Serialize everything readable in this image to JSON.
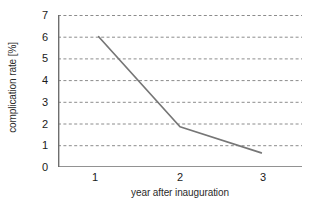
{
  "chart_data": {
    "type": "line",
    "title": "",
    "subtitle": "",
    "xlabel": "year after inauguration",
    "ylabel": "complication rate [%]",
    "categories": [
      "1",
      "2",
      "3"
    ],
    "x": [
      1,
      2,
      3
    ],
    "values": [
      6.0,
      1.85,
      0.65
    ],
    "series": [
      {
        "name": "complication rate",
        "values": [
          6.0,
          1.85,
          0.65
        ]
      }
    ],
    "xlim": [
      0.5,
      3.5
    ],
    "ylim": [
      0,
      7
    ],
    "yticks": [
      0,
      1,
      2,
      3,
      4,
      5,
      6,
      7
    ],
    "ytick_labels": [
      "0",
      "1",
      "2",
      "3",
      "4",
      "5",
      "6",
      "7"
    ],
    "xtick_labels": [
      "1",
      "2",
      "3"
    ],
    "grid": "horizontal-dashed",
    "legend": "none",
    "markers": "none",
    "annotations": [],
    "colors": {
      "line": "#767676",
      "grid": "#8c8c8c",
      "axis": "#6e6e6e",
      "text": "#1a1a1a",
      "background": "#ffffff"
    }
  }
}
